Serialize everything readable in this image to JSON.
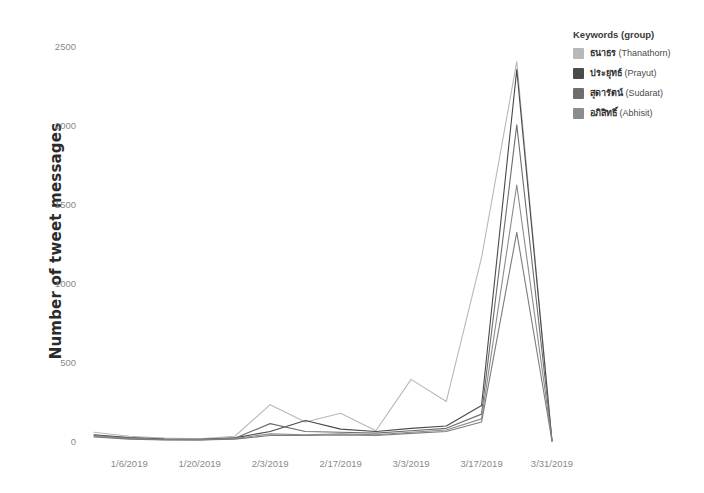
{
  "chart_data": {
    "type": "line",
    "title": "",
    "xlabel": "",
    "ylabel": "Number of tweet messages",
    "ylim": [
      0,
      2550
    ],
    "yticks": [
      0,
      500,
      1000,
      1500,
      2000,
      2500
    ],
    "ytick_labels": [
      "0",
      "500",
      "1000",
      "1500",
      "2000",
      "2500"
    ],
    "xtick_labels": [
      "1/6/2019",
      "1/20/2019",
      "2/3/2019",
      "2/17/2019",
      "3/3/2019",
      "3/17/2019",
      "3/31/2019"
    ],
    "x": [
      "12/30/2018",
      "1/6/2019",
      "1/13/2019",
      "1/20/2019",
      "1/27/2019",
      "2/3/2019",
      "2/10/2019",
      "2/17/2019",
      "2/24/2019",
      "3/3/2019",
      "3/10/2019",
      "3/17/2019",
      "3/24/2019",
      "3/31/2019"
    ],
    "grid": false,
    "legend_position": "right",
    "legend_title": "Keywords (group)",
    "series": [
      {
        "name": "thanathorn",
        "label_native": "ธนาธร",
        "label_roman": "(Thanathorn)",
        "color": "#b8b8b8",
        "values": [
          55,
          30,
          18,
          14,
          30,
          230,
          120,
          175,
          65,
          390,
          250,
          1160,
          2400,
          0
        ]
      },
      {
        "name": "prayut",
        "label_native": "ประยุทธ์",
        "label_roman": "(Prayut)",
        "color": "#4a4a4a",
        "values": [
          40,
          22,
          12,
          10,
          20,
          60,
          130,
          75,
          60,
          80,
          95,
          225,
          2350,
          0
        ]
      },
      {
        "name": "sudarat",
        "label_native": "สุดารัตน์",
        "label_roman": "(Sudarat)",
        "color": "#6e6e6e",
        "values": [
          35,
          18,
          10,
          8,
          18,
          110,
          60,
          55,
          50,
          65,
          80,
          170,
          2000,
          0
        ]
      },
      {
        "name": "abhisit",
        "label_native": "อภิสิทธิ์",
        "label_roman": "(Abhisit)",
        "color": "#8c8c8c",
        "values": [
          30,
          15,
          8,
          7,
          15,
          45,
          40,
          45,
          40,
          55,
          70,
          140,
          1620,
          0
        ]
      },
      {
        "name": "abhisit_lower",
        "label_native": "",
        "label_roman": "",
        "color": "#7d7d7d",
        "values": [
          25,
          12,
          7,
          6,
          12,
          35,
          35,
          38,
          35,
          48,
          60,
          120,
          1320,
          0
        ]
      }
    ]
  },
  "legend": {
    "title": "Keywords (group)",
    "items": [
      {
        "native": "ธนาธร",
        "roman": "(Thanathorn)",
        "color": "#b8b8b8"
      },
      {
        "native": "ประยุทธ์",
        "roman": "(Prayut)",
        "color": "#4a4a4a"
      },
      {
        "native": "สุดารัตน์",
        "roman": "(Sudarat)",
        "color": "#6e6e6e"
      },
      {
        "native": "อภิสิทธิ์",
        "roman": "(Abhisit)",
        "color": "#8c8c8c"
      }
    ]
  }
}
